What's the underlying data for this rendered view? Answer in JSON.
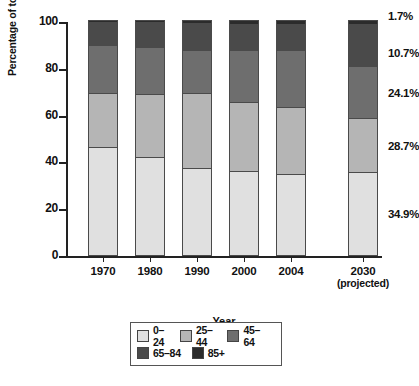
{
  "chart_data": {
    "type": "bar",
    "subtype": "stacked-bar",
    "title": "",
    "xlabel": "Year",
    "ylabel": "Percentage of total population",
    "ylim": [
      0,
      100
    ],
    "yticks": [
      0,
      20,
      40,
      60,
      80,
      100
    ],
    "grid": false,
    "legend_position": "bottom-center",
    "stack_order_bottom_to_top": [
      "0–24",
      "25–44",
      "45–64",
      "65–84",
      "85+"
    ],
    "categories": [
      "1970",
      "1980",
      "1990",
      "2000",
      "2004",
      "2030"
    ],
    "category_sublabels": [
      "",
      "",
      "",
      "",
      "",
      "(projected)"
    ],
    "series": [
      {
        "name": "0–24",
        "color": "#e0e0e0",
        "values": [
          45.7,
          41.3,
          36.6,
          35.3,
          34.4,
          34.9
        ]
      },
      {
        "name": "25–44",
        "color": "#b5b5b5",
        "values": [
          23.3,
          27.2,
          32.0,
          29.5,
          28.6,
          23.4
        ]
      },
      {
        "name": "45–64",
        "color": "#6e6e6e",
        "values": [
          20.5,
          20.0,
          18.4,
          22.4,
          24.0,
          22.0
        ]
      },
      {
        "name": "65–84",
        "color": "#4a4a4a",
        "values": [
          9.8,
          10.5,
          11.7,
          11.3,
          11.3,
          18.0
        ]
      },
      {
        "name": "85+",
        "color": "#2b2b2b",
        "values": [
          0.7,
          1.0,
          1.3,
          1.5,
          1.7,
          1.7
        ]
      }
    ],
    "annotations": [
      {
        "text": "1.7%",
        "series": "85+",
        "category": "2030"
      },
      {
        "text": "10.7%",
        "series": "65–84",
        "category": "2030"
      },
      {
        "text": "24.1%",
        "series": "45–64",
        "category": "2030"
      },
      {
        "text": "28.7%",
        "series": "25–44",
        "category": "2030"
      },
      {
        "text": "34.9%",
        "series": "0–24",
        "category": "2030"
      }
    ]
  },
  "legend": {
    "rows": [
      [
        {
          "label": "0–24",
          "color": "#e0e0e0"
        },
        {
          "label": "25–44",
          "color": "#b5b5b5"
        },
        {
          "label": "45–64",
          "color": "#6e6e6e"
        }
      ],
      [
        {
          "label": "65–84",
          "color": "#4a4a4a"
        },
        {
          "label": "85+",
          "color": "#2b2b2b"
        }
      ]
    ]
  },
  "artifacts": {
    "top_clipped_text": "",
    "bottom_clipped_caption": ""
  }
}
